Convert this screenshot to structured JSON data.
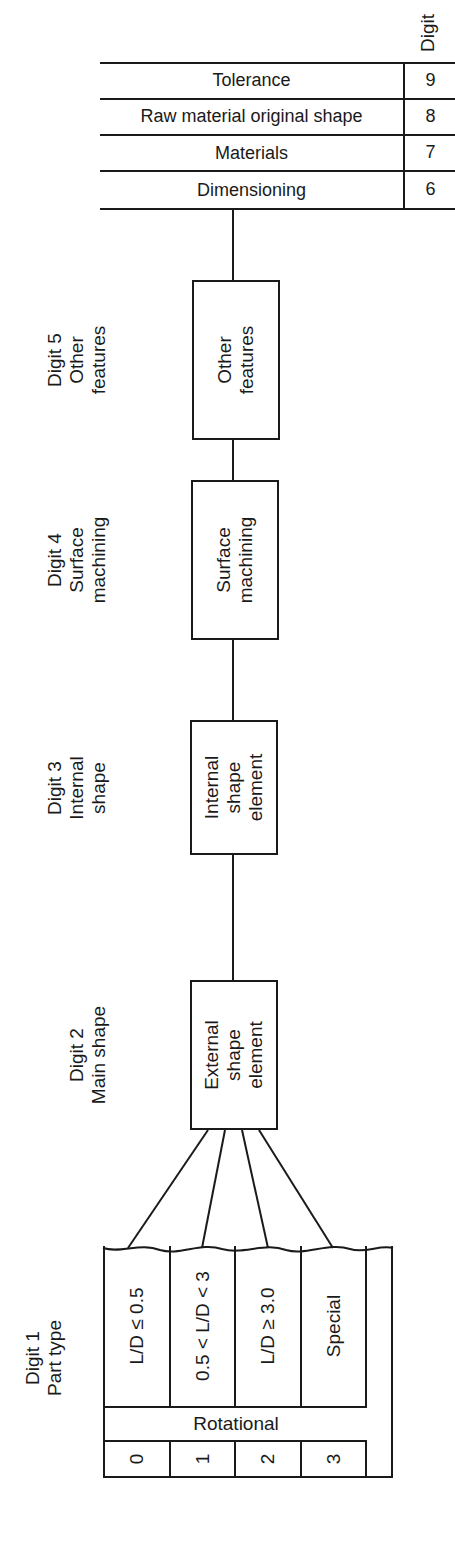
{
  "diagram": {
    "orientation": "rotated-90-ccw",
    "colors": {
      "ink": "#1a1a1a",
      "background": "#ffffff"
    },
    "digit1": {
      "heading_line1": "Digit 1",
      "heading_line2": "Part type",
      "group_label": "Rotational",
      "rows": [
        {
          "code": "0",
          "description": "L/D ≤ 0.5"
        },
        {
          "code": "1",
          "description": "0.5 < L/D < 3"
        },
        {
          "code": "2",
          "description": "L/D ≥ 3.0"
        },
        {
          "code": "3",
          "description": "Special"
        }
      ]
    },
    "digit2": {
      "heading_line1": "Digit 2",
      "heading_line2": "Main shape",
      "box_line1": "External",
      "box_line2": "shape",
      "box_line3": "element"
    },
    "digit3": {
      "heading_line1": "Digit 3",
      "heading_line2": "Internal",
      "heading_line3": "shape",
      "box_line1": "Internal",
      "box_line2": "shape",
      "box_line3": "element"
    },
    "digit4": {
      "heading_line1": "Digit 4",
      "heading_line2": "Surface",
      "heading_line3": "machining",
      "box_line1": "Surface",
      "box_line2": "machining"
    },
    "digit5": {
      "heading_line1": "Digit 5",
      "heading_line2": "Other",
      "heading_line3": "features",
      "box_line1": "Other",
      "box_line2": "features"
    },
    "supplementary": {
      "header": "Digit",
      "rows": [
        {
          "code": "6",
          "description": "Dimensioning"
        },
        {
          "code": "7",
          "description": "Materials"
        },
        {
          "code": "8",
          "description": "Raw material original shape"
        },
        {
          "code": "9",
          "description": "Tolerance"
        }
      ]
    }
  }
}
